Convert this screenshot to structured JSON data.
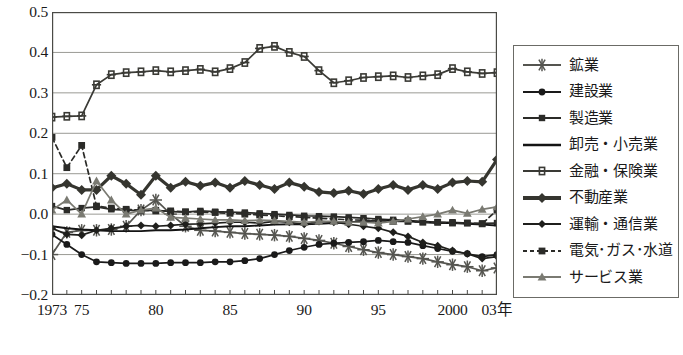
{
  "chart_data": {
    "type": "line",
    "title": "",
    "xlabel": "年",
    "ylabel": "",
    "ylim": [
      -0.2,
      0.5
    ],
    "xlim": [
      1973,
      2003
    ],
    "grid": true,
    "legend_position": "right",
    "y_ticks": [
      "0.5",
      "0.4",
      "0.3",
      "0.2",
      "0.1",
      "0.0",
      "-0.1",
      "-0.2"
    ],
    "y_tick_values": [
      0.5,
      0.4,
      0.3,
      0.2,
      0.1,
      0.0,
      -0.1,
      -0.2
    ],
    "x_ticks": [
      "1973",
      "75",
      "80",
      "85",
      "90",
      "95",
      "2000",
      "03年"
    ],
    "x_tick_values": [
      1973,
      1975,
      1980,
      1985,
      1990,
      1995,
      2000,
      2003
    ],
    "x": [
      1973,
      1974,
      1975,
      1976,
      1977,
      1978,
      1979,
      1980,
      1981,
      1982,
      1983,
      1984,
      1985,
      1986,
      1987,
      1988,
      1989,
      1990,
      1991,
      1992,
      1993,
      1994,
      1995,
      1996,
      1997,
      1998,
      1999,
      2000,
      2001,
      2002,
      2003
    ],
    "series": [
      {
        "name": "鉱業",
        "marker": "asterisk",
        "color": "#555550",
        "values": [
          -0.1,
          -0.045,
          -0.04,
          -0.04,
          -0.038,
          -0.03,
          0.01,
          0.035,
          0.0,
          -0.03,
          -0.04,
          -0.042,
          -0.045,
          -0.048,
          -0.05,
          -0.052,
          -0.055,
          -0.06,
          -0.065,
          -0.072,
          -0.08,
          -0.088,
          -0.095,
          -0.1,
          -0.105,
          -0.11,
          -0.118,
          -0.125,
          -0.13,
          -0.14,
          -0.133
        ]
      },
      {
        "name": "建設業",
        "marker": "circle",
        "color": "#1a1a1a",
        "values": [
          -0.05,
          -0.075,
          -0.1,
          -0.118,
          -0.12,
          -0.122,
          -0.122,
          -0.122,
          -0.12,
          -0.12,
          -0.12,
          -0.118,
          -0.118,
          -0.115,
          -0.11,
          -0.1,
          -0.09,
          -0.082,
          -0.075,
          -0.072,
          -0.07,
          -0.068,
          -0.065,
          -0.068,
          -0.07,
          -0.078,
          -0.085,
          -0.092,
          -0.098,
          -0.105,
          -0.1
        ]
      },
      {
        "name": "製造業",
        "marker": "square",
        "color": "#2b2b28",
        "values": [
          0.02,
          0.01,
          0.015,
          0.018,
          0.012,
          0.01,
          0.008,
          0.01,
          0.006,
          0.005,
          0.008,
          0.006,
          0.005,
          0.004,
          0.002,
          0.0,
          -0.002,
          -0.004,
          -0.005,
          -0.006,
          -0.008,
          -0.01,
          -0.012,
          -0.014,
          -0.016,
          -0.018,
          -0.02,
          -0.02,
          -0.022,
          -0.023,
          -0.022
        ]
      },
      {
        "name": "卸売・小売業",
        "marker": "none",
        "color": "#141414",
        "values": [
          -0.03,
          -0.035,
          -0.038,
          -0.04,
          -0.042,
          -0.042,
          -0.042,
          -0.04,
          -0.04,
          -0.038,
          -0.035,
          -0.032,
          -0.03,
          -0.03,
          -0.028,
          -0.026,
          -0.025,
          -0.025,
          -0.024,
          -0.022,
          -0.02,
          -0.018,
          -0.016,
          -0.015,
          -0.018,
          -0.02,
          -0.022,
          -0.022,
          -0.024,
          -0.026,
          -0.028
        ]
      },
      {
        "name": "金融・保険業",
        "marker": "plussquare",
        "color": "#3a3a35",
        "values": [
          0.24,
          0.242,
          0.243,
          0.32,
          0.345,
          0.35,
          0.352,
          0.355,
          0.352,
          0.355,
          0.358,
          0.352,
          0.36,
          0.375,
          0.41,
          0.415,
          0.4,
          0.39,
          0.355,
          0.325,
          0.33,
          0.338,
          0.34,
          0.342,
          0.338,
          0.342,
          0.345,
          0.36,
          0.352,
          0.348,
          0.35
        ]
      },
      {
        "name": "不動産業",
        "marker": "thickdiamond",
        "color": "#35352f",
        "values": [
          0.065,
          0.075,
          0.06,
          0.06,
          0.095,
          0.075,
          0.048,
          0.095,
          0.065,
          0.08,
          0.07,
          0.078,
          0.065,
          0.082,
          0.072,
          0.062,
          0.078,
          0.068,
          0.055,
          0.052,
          0.058,
          0.05,
          0.062,
          0.072,
          0.06,
          0.072,
          0.062,
          0.078,
          0.082,
          0.08,
          0.135
        ]
      },
      {
        "name": "運輸・通信業",
        "marker": "diamond",
        "color": "#1f1f1c",
        "values": [
          -0.035,
          -0.05,
          -0.052,
          -0.04,
          -0.035,
          -0.03,
          -0.028,
          -0.03,
          -0.028,
          -0.025,
          -0.024,
          -0.022,
          -0.02,
          -0.02,
          -0.022,
          -0.018,
          -0.02,
          -0.025,
          -0.018,
          -0.02,
          -0.025,
          -0.03,
          -0.035,
          -0.045,
          -0.055,
          -0.07,
          -0.078,
          -0.09,
          -0.098,
          -0.11,
          -0.105
        ]
      },
      {
        "name": "電気･ガス･水道",
        "marker": "dashsquare",
        "color": "#2b2b28",
        "values": [
          0.19,
          0.115,
          0.17,
          0.02,
          0.015,
          0.012,
          0.01,
          0.008,
          0.008,
          0.006,
          0.005,
          0.004,
          0.002,
          0.0,
          -0.002,
          -0.004,
          -0.006,
          -0.008,
          -0.01,
          -0.012,
          -0.014,
          -0.015,
          -0.016,
          -0.018,
          -0.018,
          -0.02,
          -0.02,
          -0.022,
          -0.022,
          -0.024,
          0.01
        ]
      },
      {
        "name": "サービス業",
        "marker": "triangle",
        "color": "#7a7a72",
        "values": [
          0.01,
          0.035,
          0.0,
          0.082,
          0.035,
          0.0,
          0.01,
          0.015,
          -0.008,
          -0.01,
          -0.012,
          -0.014,
          -0.014,
          -0.016,
          -0.015,
          -0.016,
          -0.018,
          -0.02,
          -0.018,
          -0.018,
          -0.02,
          -0.02,
          -0.022,
          -0.018,
          -0.012,
          -0.006,
          0.0,
          0.01,
          0.002,
          0.012,
          0.018
        ]
      }
    ]
  },
  "legend": {
    "items": [
      {
        "label": "鉱業",
        "marker": "asterisk"
      },
      {
        "label": "建設業",
        "marker": "circle"
      },
      {
        "label": "製造業",
        "marker": "square"
      },
      {
        "label": "卸売・小売業",
        "marker": "none"
      },
      {
        "label": "金融・保険業",
        "marker": "plussquare"
      },
      {
        "label": "不動産業",
        "marker": "thickdiamond"
      },
      {
        "label": "運輸・通信業",
        "marker": "diamond"
      },
      {
        "label": "電気･ガス･水道",
        "marker": "dashsquare"
      },
      {
        "label": "サービス業",
        "marker": "triangle"
      }
    ]
  }
}
